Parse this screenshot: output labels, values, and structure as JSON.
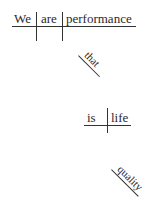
{
  "diagram": {
    "type": "sentence-diagram",
    "main_clause": {
      "subject": "We",
      "verb": "are",
      "predicate_nominative": "performance"
    },
    "relative_clause": {
      "connector": "that",
      "subject": "is",
      "object": "life"
    },
    "modifier": "quality"
  }
}
